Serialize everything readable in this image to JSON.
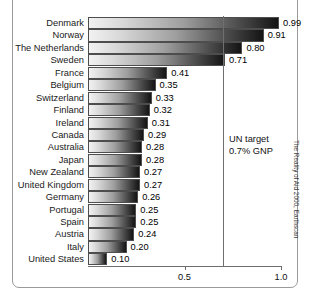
{
  "chart_data": {
    "type": "bar",
    "orientation": "horizontal",
    "title": "",
    "xlabel": "",
    "ylabel": "",
    "xlim": [
      0,
      1.05
    ],
    "xticks": [
      0.5,
      1.0
    ],
    "xtick_labels": [
      "0.5",
      "1.0"
    ],
    "grid": false,
    "categories": [
      "Denmark",
      "Norway",
      "The Netherlands",
      "Sweden",
      "France",
      "Belgium",
      "Switzerland",
      "Finland",
      "Ireland",
      "Canada",
      "Australia",
      "Japan",
      "New Zealand",
      "United Kingdom",
      "Germany",
      "Portugal",
      "Spain",
      "Austria",
      "Italy",
      "United States"
    ],
    "values": [
      0.99,
      0.91,
      0.8,
      0.71,
      0.41,
      0.35,
      0.33,
      0.32,
      0.31,
      0.29,
      0.28,
      0.28,
      0.27,
      0.27,
      0.26,
      0.25,
      0.25,
      0.24,
      0.2,
      0.1
    ],
    "value_labels": [
      "0.99",
      "0.91",
      "0.80",
      "0.71",
      "0.41",
      "0.35",
      "0.33",
      "0.32",
      "0.31",
      "0.29",
      "0.28",
      "0.28",
      "0.27",
      "0.27",
      "0.26",
      "0.25",
      "0.25",
      "0.24",
      "0.20",
      "0.10"
    ],
    "annotations": [
      {
        "name": "un-target",
        "value": 0.7,
        "line1": "UN target",
        "line2": "0.7% GNP"
      }
    ],
    "legend": []
  },
  "figure": {
    "title_clipped": "",
    "credit": "The Reality of Aid 2000, Earthscan"
  }
}
